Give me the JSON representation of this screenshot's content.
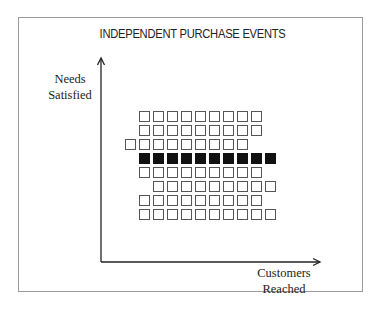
{
  "title": "INDEPENDENT PURCHASE EVENTS",
  "y_axis": {
    "line1": "Needs",
    "line2": "Satisfied"
  },
  "x_axis": {
    "line1": "Customers",
    "line2": "Reached"
  },
  "colors": {
    "filled": "#111111",
    "outline": "#555555",
    "frame": "#9a9a9a"
  },
  "grid": {
    "square_size": 11,
    "pitch": 14,
    "rows": [
      {
        "start_col": 1,
        "count": 9,
        "filled": false
      },
      {
        "start_col": 1,
        "count": 9,
        "filled": false
      },
      {
        "start_col": 0,
        "count": 9,
        "filled": false
      },
      {
        "start_col": 1,
        "count": 10,
        "filled": true
      },
      {
        "start_col": 1,
        "count": 9,
        "filled": false
      },
      {
        "start_col": 2,
        "count": 9,
        "filled": false
      },
      {
        "start_col": 1,
        "count": 9,
        "filled": false
      },
      {
        "start_col": 1,
        "count": 10,
        "filled": false
      }
    ]
  }
}
